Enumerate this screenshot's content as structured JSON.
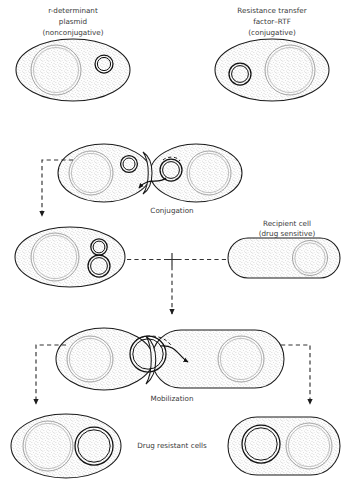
{
  "figure": {
    "type": "biology-process-diagram"
  },
  "labels": {
    "top_left": "r-determinant\nplasmid\n(nonconjugative)",
    "top_left_line1": "r-determinant",
    "top_left_line2": "plasmid",
    "top_left_line3": "(nonconjugative)",
    "top_right_line1": "Resistance transfer",
    "top_right_line2": "factor–RTF",
    "top_right_line3": "(conjugative)",
    "conjugation": "Conjugation",
    "recipient_line1": "Recipient cell",
    "recipient_line2": "(drug sensitive)",
    "plus": "+",
    "mobilization": "Mobilization",
    "result": "Drug resistant cells"
  },
  "colors": {
    "cell_outline": "#1b1b1b",
    "nucleoid_stroke": "#9a9a9a",
    "plasmid_stroke": "#111111",
    "arrow": "#333333",
    "text": "#3a3a3a",
    "background": "#ffffff",
    "stipple": "#8d8d8d"
  },
  "stages": [
    {
      "id": "donor-r-determinant",
      "shape": "oval",
      "label_keys": [
        "top_left_line1",
        "top_left_line2",
        "top_left_line3"
      ],
      "contents": [
        "nucleoid-left-large",
        "plasmid-right-small"
      ]
    },
    {
      "id": "donor-rtf",
      "shape": "oval",
      "label_keys": [
        "top_right_line1",
        "top_right_line2",
        "top_right_line3"
      ],
      "contents": [
        "plasmid-left-small",
        "nucleoid-right-large"
      ]
    },
    {
      "id": "conjugation-pair",
      "shape": "two-ovals-joined",
      "label_keys": [
        "conjugation"
      ],
      "contents": [
        "nucleoid-left",
        "plasmid-r-determinant",
        "plasmid-rtf-transferring",
        "nucleoid-right"
      ],
      "arrow_direction": "right-to-left"
    },
    {
      "id": "donor-combined-R-plasmid",
      "shape": "oval",
      "contents": [
        "nucleoid-left-large",
        "plasmid-stacked-double"
      ]
    },
    {
      "id": "recipient-cell",
      "shape": "rod",
      "label_keys": [
        "recipient_line1",
        "recipient_line2"
      ],
      "contents": [
        "nucleoid-right-large"
      ]
    },
    {
      "id": "mobilization-pair",
      "shape": "oval-plus-rod-joined",
      "label_keys": [
        "mobilization"
      ],
      "contents": [
        "nucleoid-left",
        "plasmid-R-transferring",
        "nucleoid-right"
      ],
      "arrow_direction": "left-to-right"
    },
    {
      "id": "result-cell-oval",
      "shape": "oval",
      "contents": [
        "nucleoid-left-large",
        "plasmid-right-large"
      ]
    },
    {
      "id": "result-cell-rod",
      "shape": "rod",
      "contents": [
        "plasmid-left-large",
        "nucleoid-right-large"
      ]
    }
  ],
  "flow_arrows": [
    {
      "from": "conjugation-pair",
      "to": "donor-combined-R-plasmid",
      "style": "dashed",
      "path": "left-down"
    },
    {
      "from": "donor-combined-R-plasmid",
      "to": "junction",
      "style": "dashed",
      "path": "right"
    },
    {
      "from": "recipient-cell",
      "to": "junction",
      "style": "dashed",
      "path": "left"
    },
    {
      "from": "junction",
      "to": "mobilization-pair",
      "style": "dashed",
      "path": "down"
    },
    {
      "from": "mobilization-pair",
      "to": "result-cell-oval",
      "style": "dashed",
      "path": "left-down"
    },
    {
      "from": "mobilization-pair",
      "to": "result-cell-rod",
      "style": "dashed",
      "path": "right-down"
    }
  ]
}
